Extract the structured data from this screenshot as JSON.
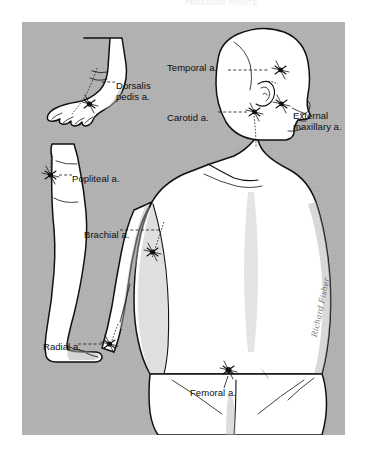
{
  "figure": {
    "scan_top_text": "PRESSURE POINTS",
    "plate_color": "#b2b2b2",
    "body_fill": "#ffffff",
    "shadow_fill": "#b2b2b2",
    "ink_color": "#111111",
    "signature": "Richard Fisher"
  },
  "labels": [
    {
      "id": "dorsalis-pedis",
      "text": "Dorsalis\npedis a.",
      "x": 116,
      "y": 80,
      "align": "left"
    },
    {
      "id": "temporal",
      "text": "Temporal a.",
      "x": 167,
      "y": 62,
      "align": "left"
    },
    {
      "id": "carotid",
      "text": "Carotid a.",
      "x": 167,
      "y": 112,
      "align": "left"
    },
    {
      "id": "external-maxillary",
      "text": "External\nmaxillary a.",
      "x": 293,
      "y": 110,
      "align": "left"
    },
    {
      "id": "popliteal",
      "text": "Popliteal a.",
      "x": 72,
      "y": 173,
      "align": "left"
    },
    {
      "id": "brachial",
      "text": "Brachial a.",
      "x": 84,
      "y": 229,
      "align": "left"
    },
    {
      "id": "radial",
      "text": "Radial a.",
      "x": 43,
      "y": 341,
      "align": "left"
    },
    {
      "id": "femoral",
      "text": "Femoral a.",
      "x": 190,
      "y": 387,
      "align": "left"
    }
  ],
  "pressure_points": [
    {
      "id": "dorsalis-pedis-point",
      "label": "Dorsalis pedis a.",
      "x": 101,
      "y": 86
    },
    {
      "id": "temporal-point",
      "label": "Temporal a.",
      "x": 251,
      "y": 70
    },
    {
      "id": "carotid-point",
      "label": "Carotid a.",
      "x": 244,
      "y": 113
    },
    {
      "id": "external-maxillary-point",
      "label": "External maxillary a.",
      "x": 272,
      "y": 104
    },
    {
      "id": "popliteal-point",
      "label": "Popliteal a.",
      "x": 50,
      "y": 176
    },
    {
      "id": "brachial-point",
      "label": "Brachial a.",
      "x": 158,
      "y": 252
    },
    {
      "id": "radial-point",
      "label": "Radial a.",
      "x": 110,
      "y": 345
    },
    {
      "id": "femoral-point",
      "label": "Femoral a.",
      "x": 229,
      "y": 374
    }
  ]
}
